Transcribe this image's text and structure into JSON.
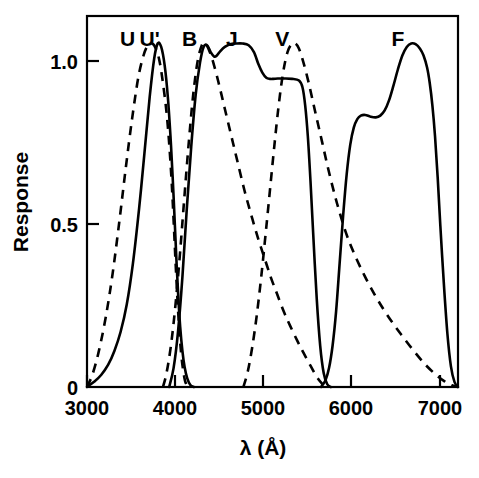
{
  "chart_data": {
    "type": "line",
    "title": "",
    "xlabel": "λ (Å)",
    "ylabel": "Response",
    "xlim": [
      3000,
      7200
    ],
    "ylim": [
      0,
      1.08
    ],
    "grid": false,
    "legend_position": "inline-above-peaks",
    "xticks": [
      3000,
      4000,
      5000,
      6000,
      7000
    ],
    "xticklabels": [
      "3000",
      "4000",
      "5000",
      "6000",
      "7000"
    ],
    "yticks": [
      0,
      0.5,
      1.0
    ],
    "yticklabels": [
      "0",
      "0.5",
      "1.0"
    ],
    "series": [
      {
        "name": "U",
        "label": "U",
        "style": "dashed",
        "label_x": 3460,
        "peak_x": 3750,
        "peak_y": 1.0,
        "x": [
          3000,
          3060,
          3130,
          3210,
          3290,
          3370,
          3440,
          3510,
          3580,
          3640,
          3690,
          3740,
          3780,
          3820,
          3860,
          3900,
          3930,
          3960,
          3985,
          4005,
          4025,
          4045,
          4065,
          4085,
          4110,
          4140
        ],
        "y": [
          0.0,
          0.035,
          0.1,
          0.2,
          0.33,
          0.49,
          0.64,
          0.78,
          0.9,
          0.965,
          0.995,
          1.0,
          0.985,
          0.95,
          0.885,
          0.8,
          0.71,
          0.59,
          0.46,
          0.35,
          0.25,
          0.165,
          0.1,
          0.055,
          0.018,
          0.0
        ]
      },
      {
        "name": "U'",
        "label": "U'",
        "style": "solid",
        "label_x": 3710,
        "peak_x": 3800,
        "peak_y": 1.0,
        "x": [
          3000,
          3080,
          3160,
          3240,
          3310,
          3380,
          3450,
          3520,
          3590,
          3650,
          3710,
          3760,
          3800,
          3840,
          3880,
          3915,
          3945,
          3970,
          3995,
          4015,
          4035,
          4055,
          4080,
          4105,
          4135,
          4170,
          4210
        ],
        "y": [
          0.0,
          0.015,
          0.035,
          0.065,
          0.105,
          0.16,
          0.24,
          0.36,
          0.52,
          0.68,
          0.845,
          0.955,
          1.0,
          0.99,
          0.935,
          0.845,
          0.73,
          0.61,
          0.47,
          0.355,
          0.255,
          0.175,
          0.105,
          0.058,
          0.025,
          0.006,
          0.0
        ]
      },
      {
        "name": "B",
        "label": "B",
        "style": "dashed",
        "label_x": 4160,
        "peak_x": 4320,
        "peak_y": 1.0,
        "x": [
          3860,
          3900,
          3950,
          4000,
          4050,
          4100,
          4150,
          4200,
          4250,
          4300,
          4340,
          4390,
          4440,
          4500,
          4560,
          4630,
          4700,
          4780,
          4860,
          4940,
          5010,
          5080,
          5150,
          5230,
          5300,
          5380,
          5450,
          5530,
          5600,
          5660,
          5700
        ],
        "y": [
          0.0,
          0.04,
          0.12,
          0.235,
          0.38,
          0.545,
          0.705,
          0.845,
          0.945,
          0.995,
          1.0,
          0.975,
          0.935,
          0.875,
          0.81,
          0.735,
          0.66,
          0.575,
          0.5,
          0.43,
          0.375,
          0.32,
          0.272,
          0.218,
          0.178,
          0.135,
          0.1,
          0.062,
          0.03,
          0.01,
          0.0
        ]
      },
      {
        "name": "J",
        "label": "J",
        "style": "solid",
        "label_x": 4640,
        "peak_x": 4800,
        "peak_y": 1.0,
        "x": [
          3930,
          3980,
          4030,
          4080,
          4130,
          4180,
          4230,
          4280,
          4320,
          4360,
          4400,
          4440,
          4470,
          4510,
          4560,
          4620,
          4690,
          4760,
          4830,
          4890,
          4940,
          4985,
          5030,
          5070,
          5110,
          5160,
          5230,
          5320,
          5400,
          5440,
          5470,
          5500,
          5530,
          5560,
          5600,
          5640,
          5680,
          5720,
          5760
        ],
        "y": [
          0.0,
          0.055,
          0.16,
          0.32,
          0.52,
          0.7,
          0.85,
          0.945,
          0.99,
          0.995,
          0.975,
          0.962,
          0.965,
          0.978,
          0.99,
          0.998,
          1.0,
          1.0,
          0.995,
          0.975,
          0.94,
          0.915,
          0.9,
          0.897,
          0.897,
          0.898,
          0.898,
          0.897,
          0.892,
          0.872,
          0.82,
          0.73,
          0.6,
          0.45,
          0.26,
          0.12,
          0.04,
          0.008,
          0.0
        ]
      },
      {
        "name": "V",
        "label": "V",
        "style": "dashed",
        "label_x": 5210,
        "peak_x": 5360,
        "peak_y": 1.0,
        "x": [
          4770,
          4820,
          4870,
          4920,
          4970,
          5020,
          5070,
          5120,
          5170,
          5220,
          5270,
          5320,
          5360,
          5400,
          5450,
          5510,
          5580,
          5660,
          5740,
          5830,
          5930,
          6030,
          6140,
          6250,
          6360,
          6470,
          6580,
          6700,
          6820,
          6940,
          7040,
          7130,
          7200
        ],
        "y": [
          0.0,
          0.045,
          0.115,
          0.205,
          0.315,
          0.44,
          0.57,
          0.7,
          0.82,
          0.915,
          0.975,
          0.999,
          1.0,
          0.985,
          0.945,
          0.885,
          0.805,
          0.715,
          0.625,
          0.535,
          0.45,
          0.385,
          0.325,
          0.272,
          0.225,
          0.183,
          0.145,
          0.105,
          0.068,
          0.038,
          0.018,
          0.005,
          0.0
        ]
      },
      {
        "name": "F",
        "label": "F",
        "style": "solid",
        "label_x": 6520,
        "peak_x": 6700,
        "peak_y": 1.0,
        "x": [
          5650,
          5700,
          5740,
          5780,
          5820,
          5860,
          5900,
          5940,
          5980,
          6020,
          6060,
          6100,
          6150,
          6210,
          6270,
          6320,
          6370,
          6420,
          6470,
          6520,
          6570,
          6620,
          6670,
          6720,
          6770,
          6810,
          6850,
          6880,
          6910,
          6940,
          6970,
          7000,
          7040,
          7080,
          7120,
          7160,
          7200
        ],
        "y": [
          0.0,
          0.02,
          0.055,
          0.12,
          0.22,
          0.36,
          0.5,
          0.62,
          0.705,
          0.755,
          0.78,
          0.79,
          0.792,
          0.787,
          0.785,
          0.79,
          0.805,
          0.835,
          0.878,
          0.925,
          0.965,
          0.99,
          1.0,
          0.998,
          0.985,
          0.965,
          0.93,
          0.885,
          0.82,
          0.73,
          0.61,
          0.47,
          0.3,
          0.155,
          0.06,
          0.015,
          0.0
        ]
      }
    ]
  },
  "axes": {
    "ylabel": "Response",
    "xlabel": "λ (Å)"
  }
}
